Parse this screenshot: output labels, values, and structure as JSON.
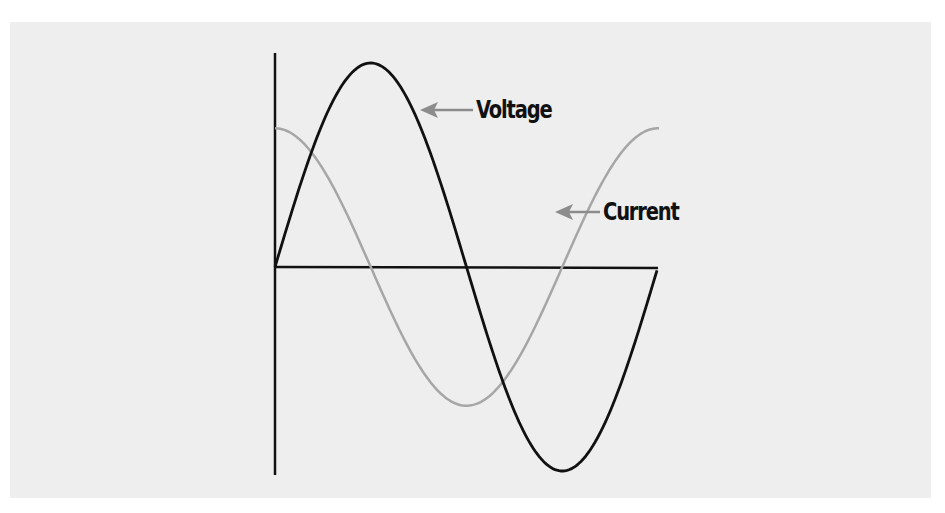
{
  "chart_data": {
    "type": "line",
    "title": "",
    "xlabel": "",
    "ylabel": "",
    "grid": false,
    "legend": "inline annotations with arrows",
    "series": [
      {
        "name": "Voltage",
        "color": "#111111",
        "shape": "sine",
        "amplitude": 1.0,
        "phase_deg": 0,
        "period_fraction_shown": 1.0
      },
      {
        "name": "Current",
        "color": "#a6a6a6",
        "shape": "sine lagging voltage",
        "amplitude": 0.68,
        "phase_deg": 90,
        "period_fraction_shown": 1.0
      }
    ],
    "annotations": [
      {
        "text": "Voltage",
        "points_to": "Voltage"
      },
      {
        "text": "Current",
        "points_to": "Current"
      }
    ]
  },
  "labels": {
    "voltage": "Voltage",
    "current": "Current"
  },
  "colors": {
    "background": "#eeeeee",
    "voltage": "#111111",
    "current": "#a6a6a6",
    "axes": "#111111",
    "arrow": "#8c8c8c"
  }
}
